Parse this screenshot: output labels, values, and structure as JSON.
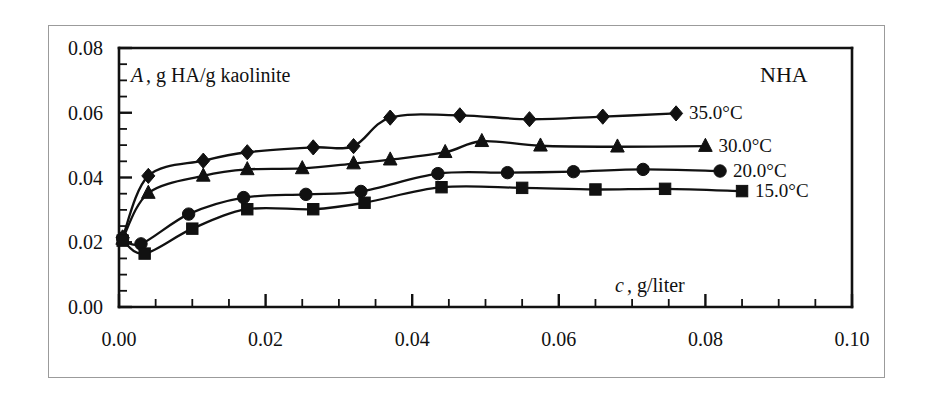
{
  "figure": {
    "corner_label": "NHA",
    "y_axis_label": "A , g HA/g kaolinite",
    "y_axis_label_italic_part": "A",
    "y_axis_label_rest": ", g HA/g kaolinite",
    "x_axis_label": "c , g/liter",
    "x_axis_label_italic_part": "c",
    "x_axis_label_rest": ", g/liter"
  },
  "chart_data": {
    "type": "line",
    "title": "",
    "subtitle": "NHA",
    "xlabel": "c , g/liter",
    "ylabel": "A , g HA/g kaolinite",
    "xlim": [
      0.0,
      0.1
    ],
    "ylim": [
      0.0,
      0.08
    ],
    "xticks": [
      0.0,
      0.02,
      0.04,
      0.06,
      0.08,
      0.1
    ],
    "yticks": [
      0.0,
      0.02,
      0.04,
      0.06,
      0.08
    ],
    "xtick_labels": [
      "0.00",
      "0.02",
      "0.04",
      "0.06",
      "0.08",
      "0.10"
    ],
    "ytick_labels": [
      "0.00",
      "0.02",
      "0.04",
      "0.06",
      "0.08"
    ],
    "minor_ticks_per_interval": 3,
    "grid": false,
    "legend_position": "right-inline",
    "series": [
      {
        "name": "35.0°C",
        "label": "35.0°C",
        "marker": "diamond",
        "color": "#111111",
        "points": [
          {
            "x": 0.0005,
            "y": 0.0215
          },
          {
            "x": 0.004,
            "y": 0.0405
          },
          {
            "x": 0.0115,
            "y": 0.0452
          },
          {
            "x": 0.0175,
            "y": 0.0478
          },
          {
            "x": 0.0265,
            "y": 0.0493
          },
          {
            "x": 0.032,
            "y": 0.0497
          },
          {
            "x": 0.037,
            "y": 0.0585
          },
          {
            "x": 0.0465,
            "y": 0.0592
          },
          {
            "x": 0.056,
            "y": 0.058
          },
          {
            "x": 0.066,
            "y": 0.0588
          },
          {
            "x": 0.076,
            "y": 0.0598
          }
        ]
      },
      {
        "name": "30.0°C",
        "label": "30.0°C",
        "marker": "triangle",
        "color": "#111111",
        "points": [
          {
            "x": 0.0005,
            "y": 0.021
          },
          {
            "x": 0.004,
            "y": 0.0352
          },
          {
            "x": 0.0115,
            "y": 0.0405
          },
          {
            "x": 0.0175,
            "y": 0.0425
          },
          {
            "x": 0.025,
            "y": 0.0428
          },
          {
            "x": 0.032,
            "y": 0.0443
          },
          {
            "x": 0.037,
            "y": 0.0455
          },
          {
            "x": 0.0445,
            "y": 0.0478
          },
          {
            "x": 0.0495,
            "y": 0.0512
          },
          {
            "x": 0.0575,
            "y": 0.0498
          },
          {
            "x": 0.068,
            "y": 0.0495
          },
          {
            "x": 0.08,
            "y": 0.0497
          }
        ]
      },
      {
        "name": "20.0°C",
        "label": "20.0°C",
        "marker": "circle",
        "color": "#111111",
        "points": [
          {
            "x": 0.0005,
            "y": 0.0212
          },
          {
            "x": 0.003,
            "y": 0.0195
          },
          {
            "x": 0.0095,
            "y": 0.0287
          },
          {
            "x": 0.017,
            "y": 0.0338
          },
          {
            "x": 0.0255,
            "y": 0.0348
          },
          {
            "x": 0.033,
            "y": 0.0357
          },
          {
            "x": 0.0435,
            "y": 0.0412
          },
          {
            "x": 0.053,
            "y": 0.0415
          },
          {
            "x": 0.062,
            "y": 0.0418
          },
          {
            "x": 0.0715,
            "y": 0.0425
          },
          {
            "x": 0.082,
            "y": 0.042
          }
        ]
      },
      {
        "name": "15.0°C",
        "label": "15.0°C",
        "marker": "square",
        "color": "#111111",
        "points": [
          {
            "x": 0.0005,
            "y": 0.0205
          },
          {
            "x": 0.0035,
            "y": 0.0165
          },
          {
            "x": 0.01,
            "y": 0.0242
          },
          {
            "x": 0.0175,
            "y": 0.0302
          },
          {
            "x": 0.0265,
            "y": 0.0302
          },
          {
            "x": 0.0335,
            "y": 0.0322
          },
          {
            "x": 0.044,
            "y": 0.037
          },
          {
            "x": 0.055,
            "y": 0.0368
          },
          {
            "x": 0.065,
            "y": 0.0363
          },
          {
            "x": 0.0745,
            "y": 0.0365
          },
          {
            "x": 0.085,
            "y": 0.0358
          }
        ]
      }
    ]
  }
}
